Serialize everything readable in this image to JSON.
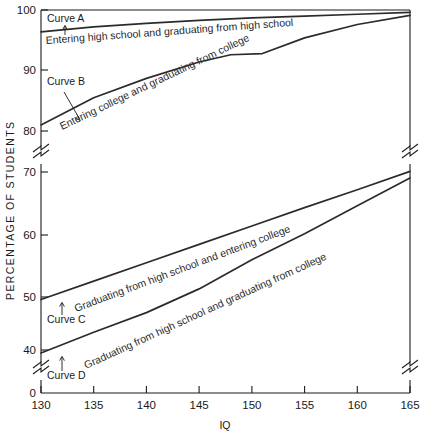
{
  "chart_data": {
    "type": "line",
    "title": "",
    "xlabel": "IQ",
    "ylabel": "PERCENTAGE OF STUDENTS",
    "xlim": [
      130,
      165
    ],
    "xticks": [
      130,
      135,
      140,
      145,
      150,
      155,
      160,
      165
    ],
    "xtick_labels": [
      "130",
      "135",
      "140",
      "145",
      "150",
      "155",
      "160",
      "165"
    ],
    "grid": false,
    "legend_position": "inline-along-curves",
    "y_axis_broken": true,
    "panels": [
      {
        "name": "upper-panel",
        "ylim": [
          80,
          100
        ],
        "yticks": [
          80,
          90,
          100
        ],
        "ytick_labels": [
          "80",
          "90",
          "100"
        ]
      },
      {
        "name": "lower-panel",
        "ylim": [
          38,
          71
        ],
        "yticks": [
          40,
          50,
          60,
          70
        ],
        "ytick_labels": [
          "40",
          "50",
          "60",
          "70"
        ],
        "zero_tick_label": "0"
      }
    ],
    "series": [
      {
        "name": "Curve A",
        "tag": "Curve A",
        "label": "Entering high school and graduating from high school",
        "panel": "upper-panel",
        "x": [
          130,
          135,
          140,
          145,
          150,
          155,
          160,
          165
        ],
        "values": [
          96.4,
          97.2,
          97.8,
          98.3,
          98.7,
          99.0,
          99.3,
          99.6
        ]
      },
      {
        "name": "Curve B",
        "tag": "Curve B",
        "label": "Entering college and graduating from college",
        "panel": "upper-panel",
        "x": [
          130,
          135,
          140,
          145,
          148,
          151,
          155,
          160,
          165
        ],
        "values": [
          81.0,
          85.5,
          88.7,
          91.4,
          92.6,
          92.8,
          95.4,
          97.6,
          99.1
        ]
      },
      {
        "name": "Curve C",
        "tag": "Curve C",
        "label": "Graduating from high school and entering college",
        "panel": "lower-panel",
        "x": [
          130,
          135,
          140,
          145,
          150,
          155,
          160,
          165
        ],
        "values": [
          48.5,
          51.6,
          54.7,
          57.8,
          60.9,
          64.0,
          67.0,
          70.1
        ]
      },
      {
        "name": "Curve D",
        "tag": "Curve D",
        "label": "Graduating from high school and graduating from college",
        "panel": "lower-panel",
        "x": [
          130,
          135,
          140,
          145,
          150,
          155,
          160,
          165
        ],
        "values": [
          39.5,
          43.0,
          46.3,
          50.3,
          55.2,
          59.6,
          64.3,
          69.0
        ]
      }
    ]
  },
  "axes": {
    "y_title": "PERCENTAGE OF STUDENTS",
    "x_title": "IQ",
    "upper_ticks": [
      "100",
      "90",
      "80"
    ],
    "lower_ticks": [
      "70",
      "60",
      "50",
      "40",
      "0"
    ],
    "x_ticks": [
      "130",
      "135",
      "140",
      "145",
      "150",
      "155",
      "160",
      "165"
    ]
  },
  "annotations": {
    "curve_a_tag": "Curve A",
    "curve_b_tag": "Curve B",
    "curve_c_tag": "Curve C",
    "curve_d_tag": "Curve D",
    "curve_a_label": "Entering high school and graduating from high school",
    "curve_b_label": "Entering college and graduating from college",
    "curve_c_label": "Graduating from high school and entering college",
    "curve_d_label": "Graduating from high school and graduating from college"
  }
}
